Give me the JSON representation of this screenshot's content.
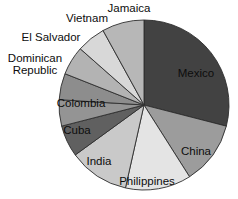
{
  "chart_data": {
    "type": "pie",
    "title": "",
    "legend_position": "none",
    "labels_on_chart": true,
    "order": "clockwise-from-top",
    "unit": "percent-of-whole",
    "stroke_color": "#2e2e2e",
    "background_color": "#ffffff",
    "series": [
      {
        "name": "Mexico",
        "value": 29,
        "color": "#424242"
      },
      {
        "name": "China",
        "value": 12,
        "color": "#9c9c9c"
      },
      {
        "name": "Philippines",
        "value": 12.5,
        "color": "#e4e4e4"
      },
      {
        "name": "India",
        "value": 11.5,
        "color": "#c9c9c9"
      },
      {
        "name": "Cuba",
        "value": 6,
        "color": "#606060"
      },
      {
        "name": "Dominican Republic",
        "value": 5,
        "color": "#8d8d8d"
      },
      {
        "name": "El Salvador",
        "value": 5.5,
        "color": "#b3b3b3"
      },
      {
        "name": "Vietnam",
        "value": 5.5,
        "color": "#d8d8d8"
      },
      {
        "name": "Jamaica",
        "value": 8,
        "color": "#b7b7b7"
      },
      {
        "name": "Colombia",
        "value": 5,
        "color": "#949494"
      }
    ],
    "slice_order_clockwise": [
      "Mexico",
      "China",
      "Philippines",
      "India",
      "Cuba",
      "Colombia",
      "Dominican Republic",
      "El Salvador",
      "Vietnam",
      "Jamaica"
    ]
  }
}
